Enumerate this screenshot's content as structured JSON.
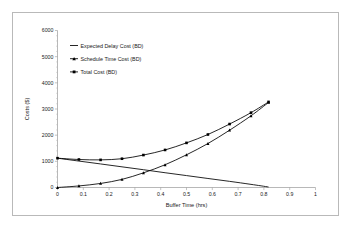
{
  "chart_data": {
    "type": "line",
    "title": "",
    "xlabel": "Buffer Time (hrs)",
    "ylabel": "Costs ($)",
    "xlim": [
      0,
      1
    ],
    "ylim": [
      0,
      6000
    ],
    "xticks": [
      "0",
      "0.1",
      "0.2",
      "0.3",
      "0.4",
      "0.5",
      "0.6",
      "0.7",
      "0.8",
      "0.9",
      "1"
    ],
    "yticks": [
      "0",
      "1000",
      "2000",
      "3000",
      "4000",
      "5000",
      "6000"
    ],
    "grid": false,
    "legend_position": "upper-left-inside",
    "series": [
      {
        "name": "Expected Delay Cost (BD)",
        "marker": "line",
        "x": [
          0,
          0.083,
          0.167,
          0.25,
          0.333,
          0.417,
          0.5,
          0.583,
          0.667,
          0.75,
          0.818
        ],
        "values": [
          1120,
          1010,
          900,
          790,
          680,
          565,
          455,
          345,
          235,
          120,
          20
        ]
      },
      {
        "name": "Schedule Time Cost (BD)",
        "marker": "triangle",
        "x": [
          0,
          0.083,
          0.167,
          0.25,
          0.333,
          0.417,
          0.5,
          0.583,
          0.667,
          0.75,
          0.818
        ],
        "values": [
          0,
          60,
          155,
          310,
          560,
          870,
          1250,
          1680,
          2190,
          2740,
          3250
        ]
      },
      {
        "name": "Total Cost (BD)",
        "marker": "square",
        "x": [
          0,
          0.083,
          0.167,
          0.25,
          0.333,
          0.417,
          0.5,
          0.583,
          0.667,
          0.75,
          0.818
        ],
        "values": [
          1120,
          1070,
          1055,
          1100,
          1240,
          1435,
          1705,
          2025,
          2425,
          2860,
          3270
        ]
      }
    ]
  },
  "legend": {
    "items": [
      {
        "label": "Expected Delay Cost (BD)",
        "marker": "line"
      },
      {
        "label": "Schedule Time Cost (BD)",
        "marker": "triangle"
      },
      {
        "label": "Total Cost (BD)",
        "marker": "square"
      }
    ]
  },
  "colors": {
    "series": "#000000",
    "axis": "#9a9a9a",
    "frame": "#b9b9b9",
    "text": "#1a1a1a",
    "background": "#ffffff"
  }
}
